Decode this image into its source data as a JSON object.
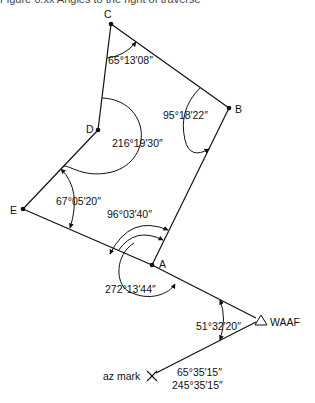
{
  "caption": "Figure 6.xx Angles to the right of traverse",
  "points": {
    "A": {
      "label": "A",
      "x": 152,
      "y": 265
    },
    "B": {
      "label": "B",
      "x": 229,
      "y": 108
    },
    "C": {
      "label": "C",
      "x": 111,
      "y": 24
    },
    "D": {
      "label": "D",
      "x": 98,
      "y": 130
    },
    "E": {
      "label": "E",
      "x": 23,
      "y": 209
    },
    "WAAF": {
      "label": "WAAF",
      "x": 261,
      "y": 320
    },
    "AZ": {
      "label": "az mark",
      "x": 152,
      "y": 376
    }
  },
  "angles": {
    "C": "65°13′08″",
    "B": "95°18′22″",
    "D": "216°19′30″",
    "E": "67°05′20″",
    "A_inner": "96°03′40″",
    "A_outer": "272°13′44″",
    "WAAF": "51°32′20″",
    "bearing_forward": "65°35′15″",
    "bearing_back": "245°35′15″"
  },
  "colors": {
    "line": "#111111",
    "text": "#111111",
    "background": "#ffffff"
  }
}
